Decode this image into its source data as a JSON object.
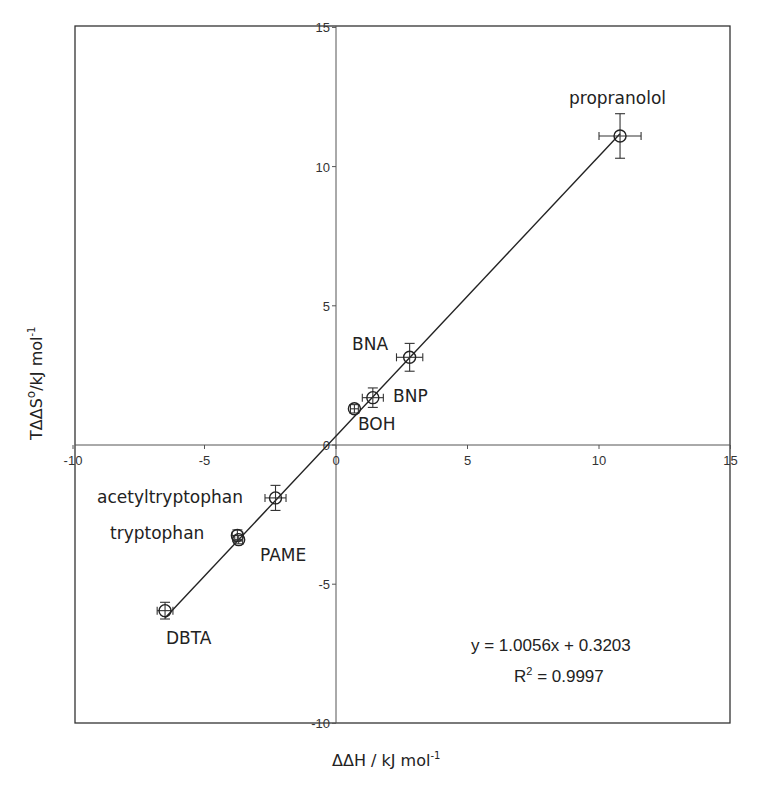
{
  "chart_data": {
    "type": "scatter",
    "title": "",
    "xlabel": "ΔΔH / kJ mol⁻¹",
    "ylabel": "TΔΔS° / kJ mol⁻¹",
    "xlim": [
      -10,
      15
    ],
    "ylim": [
      -10,
      15
    ],
    "x_ticks": [
      -10,
      -5,
      0,
      5,
      10,
      15
    ],
    "y_ticks": [
      -10,
      -5,
      0,
      5,
      10,
      15
    ],
    "grid": false,
    "legend": null,
    "points": [
      {
        "label": "propranolol",
        "x": 10.8,
        "y": 11.1,
        "xerr": 0.8,
        "yerr": 0.8
      },
      {
        "label": "BNA",
        "x": 2.8,
        "y": 3.15,
        "xerr": 0.5,
        "yerr": 0.5
      },
      {
        "label": "BNP",
        "x": 1.4,
        "y": 1.7,
        "xerr": 0.4,
        "yerr": 0.35
      },
      {
        "label": "BOH",
        "x": 0.7,
        "y": 1.3,
        "xerr": 0.15,
        "yerr": 0.15
      },
      {
        "label": "acetyltryptophan",
        "x": -2.3,
        "y": -1.9,
        "xerr": 0.4,
        "yerr": 0.45
      },
      {
        "label": "tryptophan",
        "x": -3.75,
        "y": -3.25,
        "xerr": 0.2,
        "yerr": 0.2
      },
      {
        "label": "PAME",
        "x": -3.7,
        "y": -3.4,
        "xerr": 0.15,
        "yerr": 0.15
      },
      {
        "label": "DBTA",
        "x": -6.5,
        "y": -5.95,
        "xerr": 0.3,
        "yerr": 0.3
      }
    ],
    "fit": {
      "slope": 1.0056,
      "intercept": 0.3203,
      "x_range": [
        -6.5,
        10.8
      ]
    },
    "annotations": {
      "equation": "y = 1.0056x + 0.3203",
      "r2_prefix": "R",
      "r2_value": " = 0.9997"
    }
  }
}
